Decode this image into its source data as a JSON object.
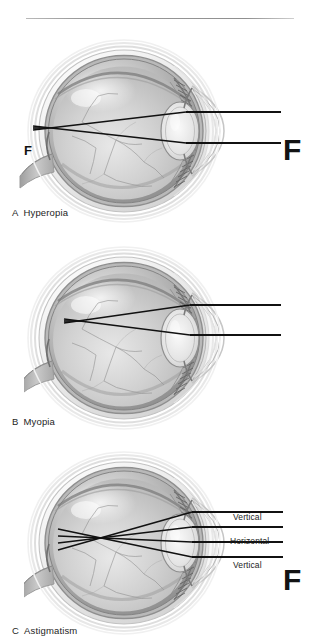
{
  "figure": {
    "background_color": "#ffffff",
    "ink_color": "#111111",
    "rule_color": "#9c9c9c",
    "title": ""
  },
  "panels": [
    {
      "id": "A",
      "letter": "A",
      "name": "Hyperopia",
      "caption": "A  Hyperopia",
      "focal_label": "F",
      "focal_marker": "F",
      "focal_position": "behind-retina",
      "ray_count": 2,
      "ray_labels": []
    },
    {
      "id": "B",
      "letter": "B",
      "name": "Myopia",
      "caption": "B  Myopia",
      "focal_label": "F",
      "focal_marker": "F",
      "focal_position": "in-front-of-retina",
      "ray_count": 2,
      "ray_labels": []
    },
    {
      "id": "C",
      "letter": "C",
      "name": "Astigmatism",
      "caption": "C  Astigmatism",
      "focal_label": "F",
      "focal_marker": "",
      "focal_position": "two-focal-lines",
      "ray_count": 4,
      "ray_labels": [
        "Vertical",
        "Horizontal",
        "Vertical"
      ]
    }
  ],
  "captions": {
    "a_letter": "A",
    "a_text": "Hyperopia",
    "b_letter": "B",
    "b_text": "Myopia",
    "c_letter": "C",
    "c_text": "Astigmatism"
  },
  "focal_points": {
    "a": "F",
    "b": "F",
    "c": "F",
    "a_marker": "F",
    "b_marker": "F"
  },
  "astigmatism_labels": {
    "vertical_top": "Vertical",
    "horizontal": "Horizontal",
    "vertical_bottom": "Vertical"
  },
  "anatomy": {
    "structures": [
      "cornea",
      "lens",
      "iris",
      "ciliary-body",
      "retina",
      "choroid",
      "sclera",
      "optic-nerve",
      "vitreous-humor"
    ]
  }
}
